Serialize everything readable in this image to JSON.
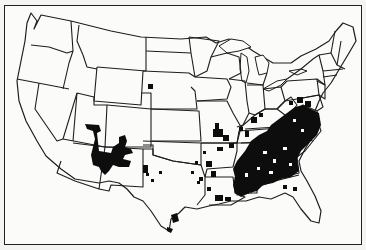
{
  "map": {
    "title": "",
    "region": "Contiguous United States",
    "type": "species distribution map",
    "colors": {
      "background": "#fbfbf9",
      "outline": "#1e1e1e",
      "range_fill": "#0d0d0d"
    },
    "legend": [],
    "range_areas": [
      {
        "name": "southwest-range",
        "description": "Southern Utah, Arizona and New Mexico"
      },
      {
        "name": "south-dakota-outlier",
        "description": "Small isolated patch in southwestern South Dakota"
      },
      {
        "name": "texas-panhandle-patches",
        "description": "Scattered patches in western Texas"
      },
      {
        "name": "south-texas-patches",
        "description": "Patches near southern Texas coast"
      },
      {
        "name": "southeast-range",
        "description": "Dense range across the Southeast: Missouri, Arkansas, Louisiana, Kentucky, Tennessee, Mississippi, Alabama, Georgia, Carolinas, Virginia, Maryland"
      }
    ]
  }
}
